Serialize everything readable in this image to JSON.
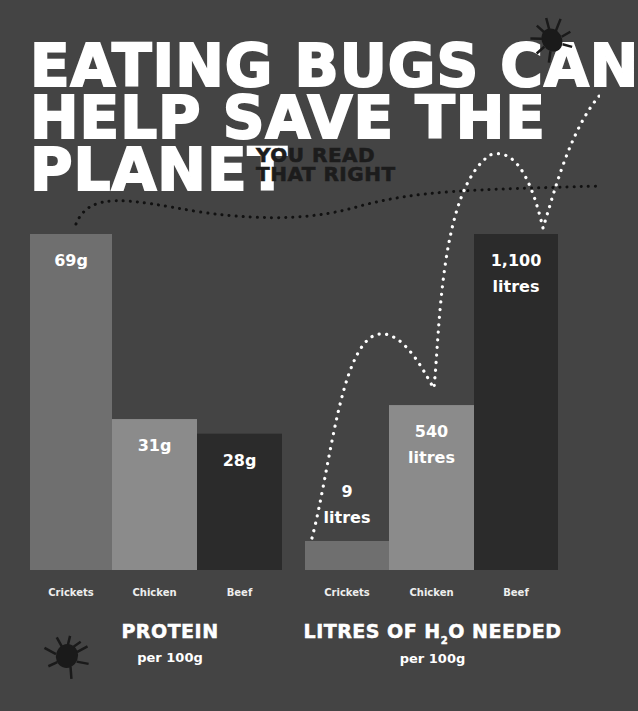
{
  "headline": {
    "lines": [
      "EATING BUGS CAN",
      "HELP SAVE THE",
      "PLANET"
    ],
    "tagline_lines": [
      "YOU READ",
      "THAT RIGHT"
    ]
  },
  "colors": {
    "background": "#444444",
    "crickets": "#6f6f6f",
    "chicken": "#8b8b8b",
    "beef": "#2b2b2b",
    "text": "#ffffff"
  },
  "chart_data": [
    {
      "type": "bar",
      "title": "PROTEIN",
      "subtitle": "per 100g",
      "categories": [
        "Crickets",
        "Chicken",
        "Beef"
      ],
      "values": [
        69,
        31,
        28
      ],
      "unit": "g",
      "data_labels": [
        "69g",
        "31g",
        "28g"
      ],
      "xlabel": "",
      "ylabel": "",
      "ylim": [
        0,
        69
      ],
      "grid": false
    },
    {
      "type": "bar",
      "title_parts": [
        "LITRES OF H",
        "2",
        "O NEEDED"
      ],
      "title": "LITRES OF H2O NEEDED",
      "subtitle": "per 100g",
      "categories": [
        "Crickets",
        "Chicken",
        "Beef"
      ],
      "values": [
        9,
        540,
        1100
      ],
      "unit": "litres",
      "data_labels": [
        [
          "9",
          "litres"
        ],
        [
          "540",
          "litres"
        ],
        [
          "1,100",
          "litres"
        ]
      ],
      "xlabel": "",
      "ylabel": "",
      "ylim": [
        0,
        1100
      ],
      "grid": false
    }
  ],
  "decorations": {
    "icons": [
      "bug-icon-top",
      "bug-icon-bottom"
    ],
    "paths": [
      "dotted-flight-path-dark",
      "dotted-flight-path-white"
    ]
  }
}
